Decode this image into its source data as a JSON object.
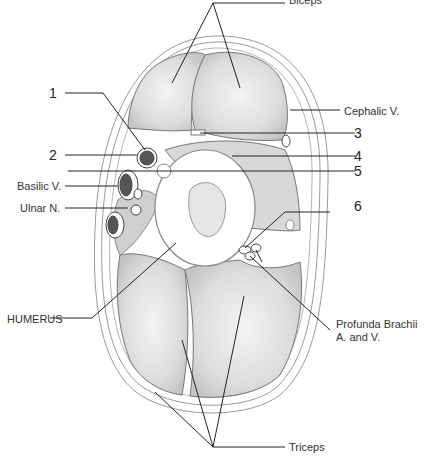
{
  "figure": {
    "labels": {
      "biceps": "Biceps",
      "cephalic_v": "Cephalic V.",
      "n1": "1",
      "n2": "2",
      "n3": "3",
      "n4": "4",
      "n5": "5",
      "n6": "6",
      "basilic_v": "Basilic V.",
      "ulnar_n": "Ulnar N.",
      "humerus": "HUMERUS",
      "profunda_line1": "Profunda Brachii",
      "profunda_line2": "A. and V.",
      "triceps": "Triceps"
    }
  }
}
